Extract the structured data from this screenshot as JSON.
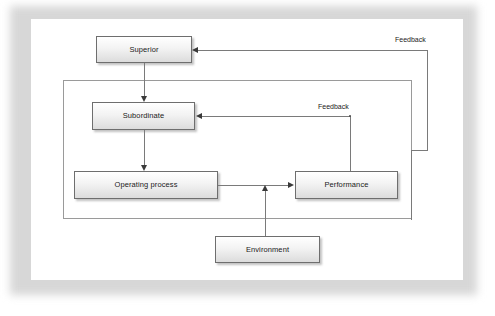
{
  "diagram": {
    "type": "control-feedback-flowchart",
    "title": "",
    "background_color": "#ffffff",
    "node_fill": "#f0f0f0",
    "node_border": "#6e6e6e",
    "line_color": "#7a7a7a",
    "nodes": [
      {
        "id": "superior",
        "label": "Superior"
      },
      {
        "id": "subordinate",
        "label": "Subordinate"
      },
      {
        "id": "operating-process",
        "label": "Operating process"
      },
      {
        "id": "performance",
        "label": "Performance"
      },
      {
        "id": "environment",
        "label": "Environment"
      }
    ],
    "edge_labels": [
      {
        "id": "feedback-outer",
        "label": "Feedback"
      },
      {
        "id": "feedback-inner",
        "label": "Feedback"
      }
    ],
    "edges": [
      {
        "from": "superior",
        "to": "subordinate",
        "label": ""
      },
      {
        "from": "subordinate",
        "to": "operating-process",
        "label": ""
      },
      {
        "from": "operating-process",
        "to": "performance",
        "label": ""
      },
      {
        "from": "environment",
        "to": "operating-process",
        "label": ""
      },
      {
        "from": "performance",
        "to": "subordinate",
        "label": "Feedback"
      },
      {
        "from": "performance",
        "to": "superior",
        "label": "Feedback"
      }
    ]
  }
}
